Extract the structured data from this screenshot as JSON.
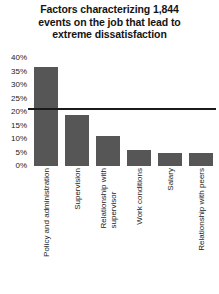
{
  "chart_data": {
    "type": "bar",
    "title": "Factors characterizing 1,844 events on the job that lead to extreme dissatisfaction",
    "title_lines": [
      "Factors characterizing 1,844",
      "events on the job that lead to",
      "extreme dissatisfaction"
    ],
    "xlabel": "",
    "ylabel": "",
    "ylim": [
      0,
      40
    ],
    "ytick_step": 5,
    "ytick_labels": [
      "40%",
      "35%",
      "30%",
      "25%",
      "20%",
      "15%",
      "10%",
      "5%",
      "0%"
    ],
    "ytick_values": [
      40,
      35,
      30,
      25,
      20,
      15,
      10,
      5,
      0
    ],
    "grid": false,
    "legend": false,
    "legend_position": "none",
    "bar_color": "#565656",
    "axis_color": "#1a1a1a",
    "categories": [
      "Policy and administration",
      "Supervision",
      "Relationship with supervisor",
      "Work conditions",
      "Salary",
      "Relationship with peers"
    ],
    "category_label_lines": [
      [
        "Policy and administration"
      ],
      [
        "Supervision"
      ],
      [
        "Relationship with",
        "supervisor"
      ],
      [
        "Work conditions"
      ],
      [
        "Salary"
      ],
      [
        "Relationship with peers"
      ]
    ],
    "values": [
      36.5,
      19,
      11,
      6,
      5,
      5
    ],
    "value_unit": "%"
  }
}
